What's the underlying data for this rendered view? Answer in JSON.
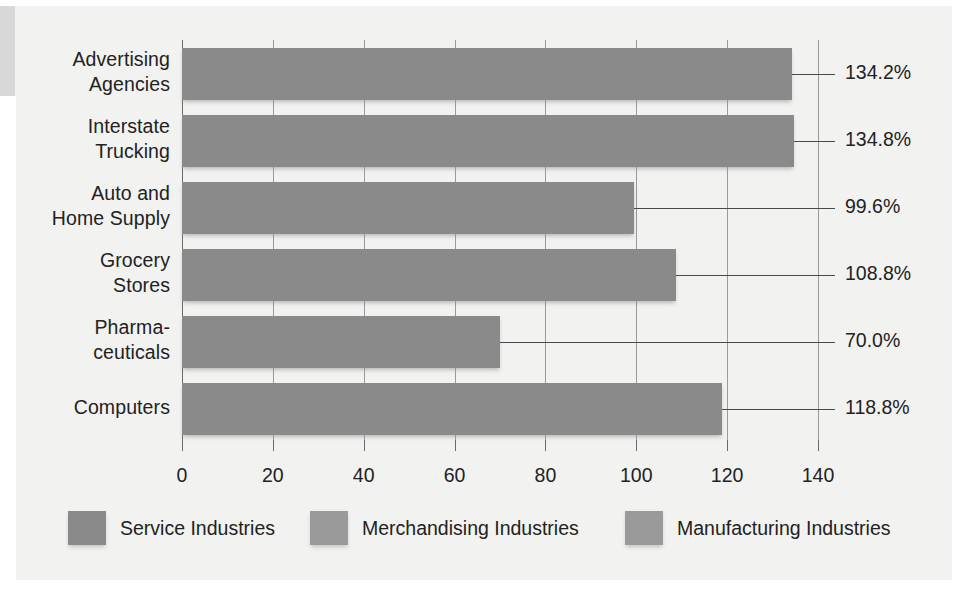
{
  "chart_data": {
    "type": "bar",
    "orientation": "horizontal",
    "title": "",
    "subtitle": "",
    "xlabel": "",
    "ylabel": "",
    "xlim": [
      0,
      140
    ],
    "ylim": null,
    "grid": true,
    "grid_axis": "x",
    "legend_position": "bottom",
    "categories": [
      "Advertising Agencies",
      "Interstate Trucking",
      "Auto and Home Supply",
      "Grocery Stores",
      "Pharmaceuticals",
      "Computers"
    ],
    "values": [
      134.2,
      134.8,
      99.6,
      108.8,
      70.0,
      118.8
    ],
    "value_labels": [
      "134.2%",
      "134.8%",
      "99.6%",
      "108.8%",
      "70.0%",
      "118.8%"
    ],
    "xticks": [
      0,
      20,
      40,
      60,
      80,
      100,
      120,
      140
    ],
    "xtick_labels": [
      "0",
      "20",
      "40",
      "60",
      "80",
      "100",
      "120",
      "140"
    ],
    "legend": [
      "Service Industries",
      "Merchandising Industries",
      "Manufacturing Industries"
    ],
    "series_assignment": [
      "Service Industries",
      "Service Industries",
      "Merchandising Industries",
      "Merchandising Industries",
      "Manufacturing Industries",
      "Manufacturing Industries"
    ]
  },
  "categories": [
    {
      "line1": "Advertising",
      "line2": "Agencies"
    },
    {
      "line1": "Interstate",
      "line2": "Trucking"
    },
    {
      "line1": "Auto and",
      "line2": "Home Supply"
    },
    {
      "line1": "Grocery",
      "line2": "Stores"
    },
    {
      "line1": "Pharma-",
      "line2": "ceuticals"
    },
    {
      "line1": "Computers",
      "line2": ""
    }
  ],
  "value_labels": [
    "134.2%",
    "134.8%",
    "99.6%",
    "108.8%",
    "70.0%",
    "118.8%"
  ],
  "xtick_labels": [
    "0",
    "20",
    "40",
    "60",
    "80",
    "100",
    "120",
    "140"
  ],
  "legend": [
    {
      "label": "Service Industries",
      "color": "#8a8a8a"
    },
    {
      "label": "Merchandising Industries",
      "color": "#9a9a9a"
    },
    {
      "label": "Manufacturing Industries",
      "color": "#9a9a9a"
    }
  ],
  "colors": {
    "background": "#f2f2f1",
    "bar": "#8a8a8a",
    "axis": "#6b6b6b",
    "grid": "#9a9a9a",
    "text": "#222222",
    "connector": "#4a4a4a"
  }
}
